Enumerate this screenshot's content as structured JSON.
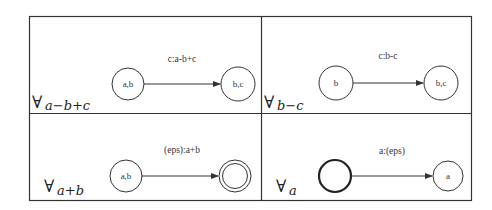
{
  "figure": {
    "panels": [
      {
        "id": "a-b+c",
        "quantifier": "∀",
        "subscript": "a−b+c",
        "edge_label": "c:a-b+c",
        "from_state": {
          "label": "a,b",
          "style": "normal"
        },
        "to_state": {
          "label": "b,c",
          "style": "normal"
        }
      },
      {
        "id": "b-c",
        "quantifier": "∀",
        "subscript": "b−c",
        "edge_label": "c:b-c",
        "from_state": {
          "label": "b",
          "style": "normal"
        },
        "to_state": {
          "label": "b,c",
          "style": "normal"
        }
      },
      {
        "id": "a+b",
        "quantifier": "∀",
        "subscript": "a+b",
        "edge_label": "(eps):a+b",
        "from_state": {
          "label": "a,b",
          "style": "normal"
        },
        "to_state": {
          "label": "",
          "style": "double"
        }
      },
      {
        "id": "a",
        "quantifier": "∀",
        "subscript": "a",
        "edge_label": "a:(eps)",
        "from_state": {
          "label": "",
          "style": "bold"
        },
        "to_state": {
          "label": "a",
          "style": "normal"
        }
      }
    ],
    "colors": {
      "stroke": "#333333",
      "text": "#333333",
      "background": "#ffffff"
    }
  }
}
